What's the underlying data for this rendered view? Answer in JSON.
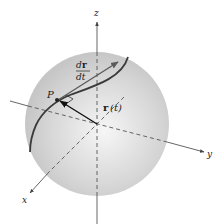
{
  "figure": {
    "labels": {
      "z_axis": "z",
      "y_axis": "y",
      "x_axis": "x",
      "point": "P",
      "position_vector_bold": "r",
      "position_vector_arg": "(t)",
      "derivative_num_d": "d",
      "derivative_num_r": "r",
      "derivative_den": "dt"
    },
    "colors": {
      "sphere_edge": "#c8c8c8",
      "sphere_center": "#f4f4f4",
      "curve": "#3a3a3a",
      "tangent_vector": "#5a5a5a",
      "position_vector": "#111111",
      "axes": "#555555"
    },
    "geometry": {
      "sphere_center": [
        97,
        124
      ],
      "sphere_radius": 72,
      "point_P": [
        58,
        100
      ],
      "tangent_tip": [
        118,
        62
      ]
    }
  }
}
